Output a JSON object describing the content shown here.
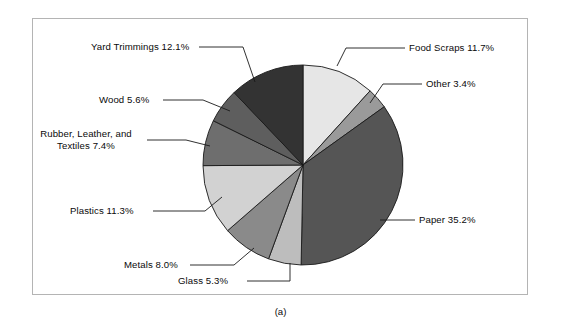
{
  "figure": {
    "caption": "(a)",
    "frame_color": "#b4b4b4",
    "background": "#ffffff"
  },
  "chart_data": {
    "type": "pie",
    "title": "",
    "xlabel": "",
    "ylabel": "",
    "legend_position": "none",
    "grid": false,
    "start_angle_deg": 0,
    "direction": "clockwise",
    "categories": [
      "Food Scraps",
      "Other",
      "Paper",
      "Glass",
      "Metals",
      "Plastics",
      "Rubber, Leather, and Textiles",
      "Wood",
      "Yard Trimmings"
    ],
    "values": [
      11.7,
      3.4,
      35.2,
      5.3,
      8.0,
      11.3,
      7.4,
      5.6,
      12.1
    ],
    "unit": "%",
    "total": 100.0,
    "colors": [
      "#e6e6e6",
      "#9a9a9a",
      "#555555",
      "#bdbdbd",
      "#8a8a8a",
      "#d2d2d2",
      "#6e6e6e",
      "#5e5e5e",
      "#333333"
    ],
    "slice_edge_color": "#1a1a1a",
    "slices": [
      {
        "name": "Food Scraps",
        "value": 11.7,
        "label": "Food Scraps 11.7%",
        "color": "#e6e6e6"
      },
      {
        "name": "Other",
        "value": 3.4,
        "label": "Other 3.4%",
        "color": "#9a9a9a"
      },
      {
        "name": "Paper",
        "value": 35.2,
        "label": "Paper 35.2%",
        "color": "#555555"
      },
      {
        "name": "Glass",
        "value": 5.3,
        "label": "Glass 5.3%",
        "color": "#bdbdbd"
      },
      {
        "name": "Metals",
        "value": 8.0,
        "label": "Metals 8.0%",
        "color": "#8a8a8a"
      },
      {
        "name": "Plastics",
        "value": 11.3,
        "label": "Plastics 11.3%",
        "color": "#d2d2d2"
      },
      {
        "name": "Rubber, Leather, and Textiles",
        "value": 7.4,
        "label": "Rubber, Leather, and Textiles 7.4%",
        "label_line1": "Rubber, Leather, and",
        "label_line2": "Textiles 7.4%",
        "color": "#6e6e6e"
      },
      {
        "name": "Wood",
        "value": 5.6,
        "label": "Wood 5.6%",
        "color": "#5e5e5e"
      },
      {
        "name": "Yard Trimmings",
        "value": 12.1,
        "label": "Yard Trimmings 12.1%",
        "color": "#333333"
      }
    ]
  }
}
